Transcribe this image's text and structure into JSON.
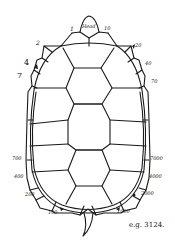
{
  "diagram": {
    "head_label": "Head",
    "specimen_label": "e.g. 3124.",
    "left_labels": [
      {
        "id": "l1",
        "text": "1"
      },
      {
        "id": "l2",
        "text": "2"
      },
      {
        "id": "l4",
        "text": "4"
      },
      {
        "id": "l7",
        "text": "7"
      },
      {
        "id": "l700",
        "text": "700"
      },
      {
        "id": "l400",
        "text": "400"
      },
      {
        "id": "l200",
        "text": "200"
      },
      {
        "id": "l100",
        "text": "100"
      }
    ],
    "right_labels": [
      {
        "id": "r10",
        "text": "10"
      },
      {
        "id": "r20",
        "text": "20"
      },
      {
        "id": "r40",
        "text": "40"
      },
      {
        "id": "r70",
        "text": "70"
      },
      {
        "id": "r7000",
        "text": "7000"
      },
      {
        "id": "r4000",
        "text": "4000"
      },
      {
        "id": "r2000",
        "text": "2000"
      },
      {
        "id": "r1000",
        "text": "1000"
      }
    ],
    "stroke_color": "#1a1a1a",
    "background_color": "#ffffff"
  }
}
